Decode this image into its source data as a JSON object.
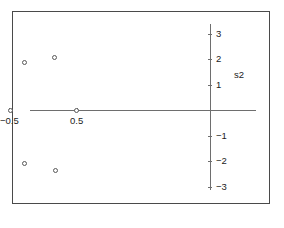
{
  "figure": {
    "background": "#ffffff",
    "frame_color": "#4a4a4a",
    "axis_color": "#6e6e6e",
    "marker_color": "#585858"
  },
  "chart_data": {
    "type": "scatter",
    "title": "",
    "xlabel": "s1",
    "ylabel": "s2",
    "grid": false,
    "legend": null,
    "xlim": [
      -2.65,
      0.7
    ],
    "ylim": [
      -3.8,
      3.55
    ],
    "xticks": [
      -2.5,
      -2,
      -1.5,
      -1,
      -0.5,
      0.5
    ],
    "xticklabels": [
      "−2.5",
      "−2",
      "−1.5",
      "−1",
      "−0.5",
      "0.5"
    ],
    "yticks": [
      3,
      2,
      1,
      -1,
      -2,
      -3
    ],
    "yticklabels": [
      "3",
      "2",
      "1",
      "−1",
      "−2",
      "−3"
    ],
    "marker": "open-circle",
    "points": [
      {
        "x": -1.0,
        "y": 2.85
      },
      {
        "x": -1.0,
        "y": 2.5
      },
      {
        "x": -1.0,
        "y": 2.15
      },
      {
        "x": -2.18,
        "y": 2.05
      },
      {
        "x": -1.77,
        "y": 1.88
      },
      {
        "x": -0.27,
        "y": 1.85
      },
      {
        "x": 0.17,
        "y": 2.05
      },
      {
        "x": -1.0,
        "y": 0.9
      },
      {
        "x": -2.5,
        "y": 0.0
      },
      {
        "x": -1.58,
        "y": 0.0
      },
      {
        "x": -0.48,
        "y": 0.0
      },
      {
        "x": 0.5,
        "y": 0.0
      },
      {
        "x": -1.0,
        "y": -0.9
      },
      {
        "x": -2.18,
        "y": -2.28
      },
      {
        "x": -1.77,
        "y": -2.08
      },
      {
        "x": -0.27,
        "y": -2.08
      },
      {
        "x": 0.19,
        "y": -2.38
      },
      {
        "x": -1.0,
        "y": -2.63
      },
      {
        "x": -1.0,
        "y": -2.98
      },
      {
        "x": -1.0,
        "y": -3.33
      }
    ]
  }
}
